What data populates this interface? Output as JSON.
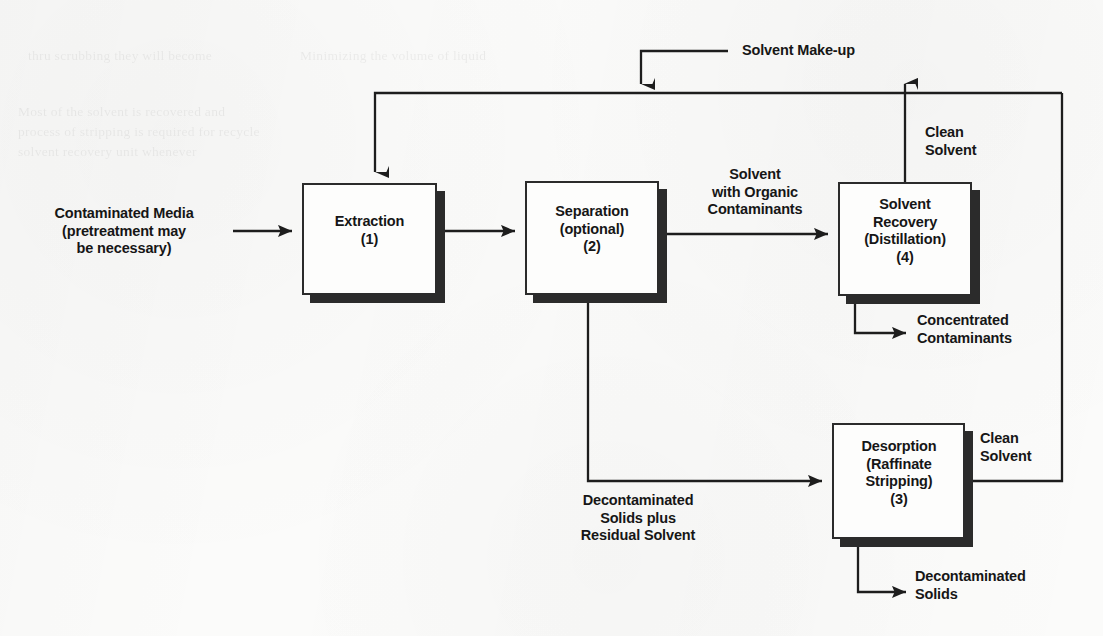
{
  "diagram": {
    "type": "process-flow",
    "ink_color": "#161616",
    "paper_color": "#fbfbfa",
    "boxes": [
      {
        "id": "extraction",
        "text": "Extraction\n(1)"
      },
      {
        "id": "separation",
        "text": "Separation\n(optional)\n(2)"
      },
      {
        "id": "solvent-recovery",
        "text": "Solvent\nRecovery\n(Distillation)\n(4)"
      },
      {
        "id": "desorption",
        "text": "Desorption\n(Raffinate\nStripping)\n(3)"
      }
    ],
    "stream_labels": {
      "feed": "Contaminated Media\n(pretreatment may\nbe necessary)",
      "solvent_makeup": "Solvent Make-up",
      "solvent_with_organics": "Solvent\nwith Organic\nContaminants",
      "clean_solvent_top": "Clean\nSolvent",
      "concentrated_contaminants": "Concentrated\nContaminants",
      "decon_solids_plus_solvent": "Decontaminated\nSolids plus\nResidual Solvent",
      "clean_solvent_bottom": "Clean\nSolvent",
      "decontaminated_solids": "Decontaminated\nSolids"
    },
    "ghost_text": [
      "thru  scrubbing  they  will  become",
      "Minimizing  the  volume  of  liquid",
      "Most  of  the  solvent  is  recovered  and",
      "process  of  stripping  is  required  for  recycle",
      "solvent  recovery  unit  whenever"
    ]
  }
}
